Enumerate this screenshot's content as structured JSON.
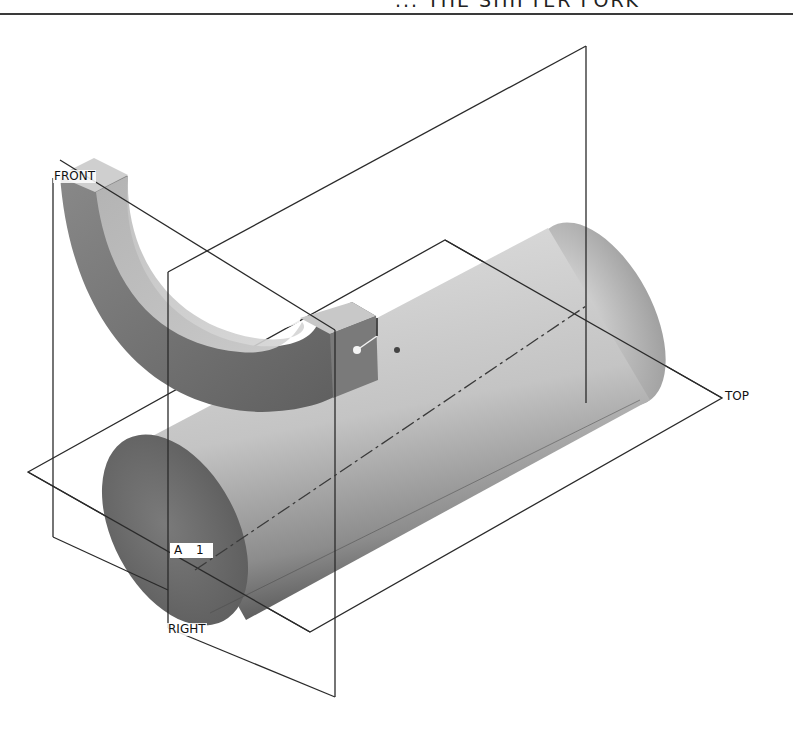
{
  "header": {
    "title": "... THE SHIFTER FORK"
  },
  "labels": {
    "front": "FRONT",
    "right": "RIGHT",
    "top": "TOP",
    "axis": "A 1"
  },
  "colors": {
    "background": "#ffffff",
    "plane_line": "#2a2a2a",
    "solid_light": "#d4d4d4",
    "solid_mid": "#a9a9a9",
    "solid_dark": "#6a6a6a"
  },
  "scene": {
    "objects": [
      {
        "name": "shifter-fork-half-ring",
        "type": "semicircular-fork"
      },
      {
        "name": "shaft-cylinder",
        "type": "cylinder"
      },
      {
        "name": "datum-plane-front",
        "type": "datum-plane"
      },
      {
        "name": "datum-plane-right",
        "type": "datum-plane"
      },
      {
        "name": "datum-plane-top",
        "type": "datum-plane"
      },
      {
        "name": "datum-axis-a1",
        "type": "datum-axis"
      }
    ]
  }
}
